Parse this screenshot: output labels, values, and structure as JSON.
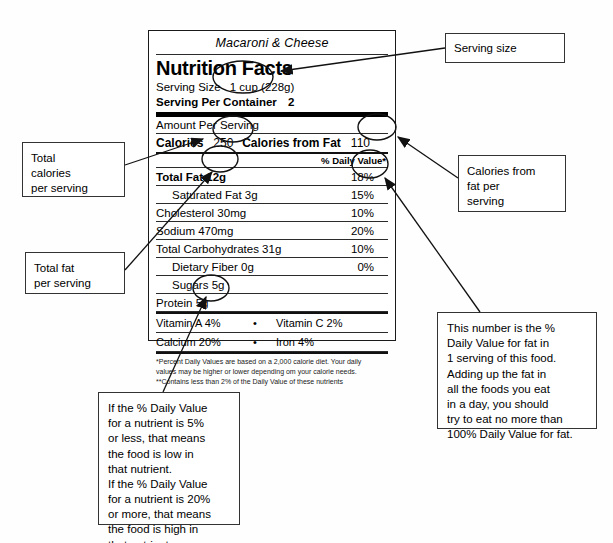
{
  "label": {
    "product_name": "Macaroni & Cheese",
    "title": "Nutrition Facts",
    "serving_size_label": "Serving Size",
    "serving_size_value": "1 cup (228g)",
    "servings_per_container_label": "Serving Per Container",
    "servings_per_container_value": "2",
    "amount_per_serving": "Amount Per Serving",
    "calories_label": "Calories",
    "calories_value": "250",
    "calories_from_fat_label": "Calories from Fat",
    "calories_from_fat_value": "110",
    "daily_value_header": "% Daily Value*",
    "nutrients": [
      {
        "name": "Total Fat",
        "amount": "12g",
        "dv": "18%",
        "bold": true,
        "indent": 0
      },
      {
        "name": "Saturated Fat",
        "amount": "3g",
        "dv": "15%",
        "bold": false,
        "indent": 1
      },
      {
        "name": "Cholesterol",
        "amount": "30mg",
        "dv": "10%",
        "bold": false,
        "indent": 0
      },
      {
        "name": "Sodium",
        "amount": "470mg",
        "dv": "20%",
        "bold": false,
        "indent": 0
      },
      {
        "name": "Total Carbohydrates",
        "amount": "31g",
        "dv": "10%",
        "bold": false,
        "indent": 0
      },
      {
        "name": "Dietary Fiber",
        "amount": "0g",
        "dv": "0%",
        "bold": false,
        "indent": 1
      },
      {
        "name": "Sugars",
        "amount": "5g",
        "dv": "",
        "bold": false,
        "indent": 1
      },
      {
        "name": "Protein",
        "amount": "5g",
        "dv": "",
        "bold": false,
        "indent": 0
      }
    ],
    "vitamins": [
      {
        "left": "Vitamin A  4%",
        "dot": "•",
        "right": "Vitamin C 2%"
      },
      {
        "left": "Calcium  20%",
        "dot": "•",
        "right": "Iron 4%"
      }
    ],
    "footnote_line1": "*Percent Daily Values are based on a 2,000 calorie diet. Your daily",
    "footnote_line2": "values may be higher or lower depending om your calorie needs.",
    "footnote_line3": "**Contains less than 2% of the Daily Value of these nutrients"
  },
  "callouts": {
    "serving_size": "Serving size",
    "total_calories": "Total\ncalories\nper serving",
    "calories_from_fat": "Calories from\nfat per\nserving",
    "total_fat": "Total fat\nper serving",
    "daily_value_fat": "This number is the %\nDaily Value for fat in\n1 serving of this food.\nAdding up the fat in\nall the foods you eat\nin a day, you should\ntry to eat no more than\n100% Daily Value for fat.",
    "daily_value_rule": "If the % Daily Value\nfor a nutrient is 5%\nor less, that means\nthe food is low in\nthat nutrient.\nIf the % Daily Value\nfor a nutrient is 20%\nor more, that means\nthe food is high in\nthat nutrient."
  },
  "colors": {
    "ink": "#000000",
    "rule": "#2b2b2b",
    "box_border": "#333333",
    "background": "#fefefe"
  }
}
